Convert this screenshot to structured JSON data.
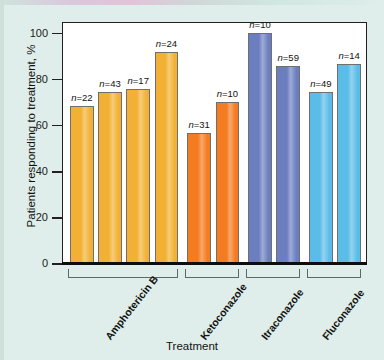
{
  "chart_data": {
    "type": "bar",
    "title": "",
    "xlabel": "Treatment",
    "ylabel": "Patients responding to treatment, %",
    "ylim": [
      0,
      105
    ],
    "yticks": [
      0,
      20,
      40,
      60,
      80,
      100
    ],
    "grid": false,
    "legend": "none",
    "groups": [
      {
        "name": "Amphotericin B",
        "color": "#F2B134",
        "bars": [
          {
            "label": "n=22",
            "n": 22,
            "value": 68
          },
          {
            "label": "n=43",
            "n": 43,
            "value": 74
          },
          {
            "label": "n=17",
            "n": 17,
            "value": 75.5
          },
          {
            "label": "n=24",
            "n": 24,
            "value": 91.5
          }
        ]
      },
      {
        "name": "Ketoconazole",
        "color": "#F47B20",
        "bars": [
          {
            "label": "n=31",
            "n": 31,
            "value": 56.5
          },
          {
            "label": "n=10",
            "n": 10,
            "value": 70
          }
        ]
      },
      {
        "name": "Itraconazole",
        "color": "#6B7FC0",
        "bars": [
          {
            "label": "n=10",
            "n": 10,
            "value": 100
          },
          {
            "label": "n=59",
            "n": 59,
            "value": 85.5
          }
        ]
      },
      {
        "name": "Fluconazole",
        "color": "#5BBCE8",
        "bars": [
          {
            "label": "n=49",
            "n": 49,
            "value": 74
          },
          {
            "label": "n=14",
            "n": 14,
            "value": 86.5
          }
        ]
      }
    ]
  },
  "figure": {
    "background_color": "#dfeeea",
    "plot_background_color": "#ffffff",
    "axis_color": "#231f20"
  }
}
